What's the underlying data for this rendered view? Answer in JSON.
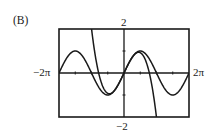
{
  "panel": {
    "label": "(B)"
  },
  "axes": {
    "x_min_label": "−2π",
    "x_max_label": "2π",
    "y_max_label": "2",
    "y_min_label": "−2"
  },
  "colors": {
    "ink": "#1a1a1a",
    "background": "#ffffff"
  },
  "chart_data": {
    "type": "line",
    "title": "",
    "panel_label": "(B)",
    "xlabel": "",
    "ylabel": "",
    "xlim": [
      -6.2832,
      6.2832
    ],
    "ylim": [
      -2,
      2
    ],
    "x_tick_labels": [
      "−2π",
      "2π"
    ],
    "y_tick_labels": [
      "2",
      "−2"
    ],
    "x_ticks_every": 1.5708,
    "y_ticks": [
      -1,
      1
    ],
    "grid": false,
    "legend": null,
    "series": [
      {
        "name": "y = sin x",
        "expression": "sin(x)",
        "x": [
          -6.2832,
          -4.7124,
          -3.1416,
          -1.5708,
          0,
          1.5708,
          3.1416,
          4.7124,
          6.2832
        ],
        "values": [
          0,
          1,
          0,
          -1,
          0,
          1,
          0,
          -1,
          0
        ]
      },
      {
        "name": "y = x - x^3/6",
        "expression": "x - x^3/6",
        "x": [
          -2.76,
          -2.45,
          -1.41,
          0,
          1.41,
          2.45,
          3.0,
          3.41
        ],
        "values": [
          2.0,
          0.0,
          -0.94,
          0,
          0.94,
          0.0,
          -1.5,
          -3.2
        ]
      }
    ]
  }
}
